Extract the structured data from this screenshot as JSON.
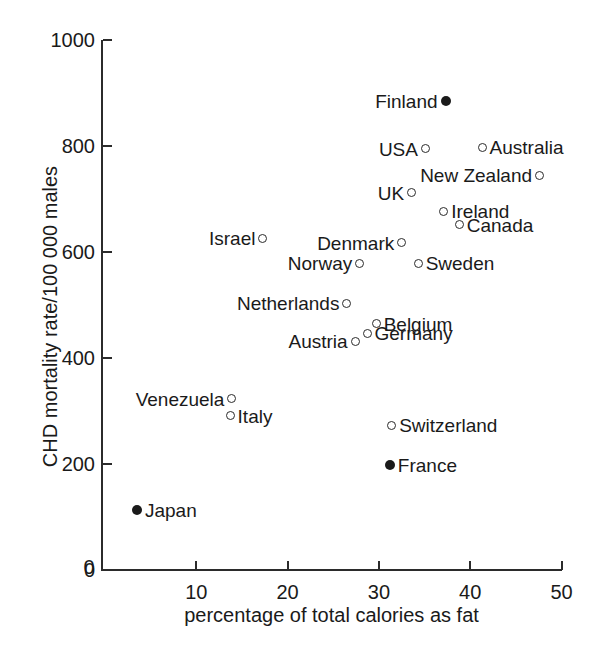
{
  "chart_data": {
    "type": "scatter",
    "title": "",
    "xlabel": "percentage of total calories as fat",
    "ylabel": "CHD mortality rate/100 000 males",
    "xlim": [
      0,
      50
    ],
    "ylim": [
      0,
      1000
    ],
    "xticks": [
      "0",
      "10",
      "20",
      "30",
      "40",
      "50"
    ],
    "xtickvalues": [
      0,
      10,
      20,
      30,
      40,
      50
    ],
    "yticks": [
      "0",
      "200",
      "400",
      "600",
      "800",
      "1000"
    ],
    "ytickvalues": [
      0,
      200,
      400,
      600,
      800,
      1000
    ],
    "grid": false,
    "legend": "none",
    "marker_styles": {
      "open": "open circle",
      "filled": "filled circle"
    },
    "points": [
      {
        "name": "Finland",
        "x": 37.3,
        "y": 885,
        "marker": "filled",
        "label_side": "left"
      },
      {
        "name": "USA",
        "x": 35.1,
        "y": 795,
        "marker": "open",
        "label_side": "left"
      },
      {
        "name": "Australia",
        "x": 41.3,
        "y": 798,
        "marker": "open",
        "label_side": "right"
      },
      {
        "name": "New Zealand",
        "x": 47.6,
        "y": 745,
        "marker": "open",
        "label_side": "left"
      },
      {
        "name": "UK",
        "x": 33.6,
        "y": 712,
        "marker": "open",
        "label_side": "left"
      },
      {
        "name": "Ireland",
        "x": 37.1,
        "y": 677,
        "marker": "open",
        "label_side": "right"
      },
      {
        "name": "Canada",
        "x": 38.8,
        "y": 651,
        "marker": "open",
        "label_side": "right"
      },
      {
        "name": "Israel",
        "x": 17.3,
        "y": 626,
        "marker": "open",
        "label_side": "left"
      },
      {
        "name": "Denmark",
        "x": 32.5,
        "y": 617,
        "marker": "open",
        "label_side": "left"
      },
      {
        "name": "Norway",
        "x": 27.9,
        "y": 579,
        "marker": "open",
        "label_side": "left"
      },
      {
        "name": "Sweden",
        "x": 34.3,
        "y": 579,
        "marker": "open",
        "label_side": "right"
      },
      {
        "name": "Netherlands",
        "x": 26.5,
        "y": 503,
        "marker": "open",
        "label_side": "left"
      },
      {
        "name": "Belgium",
        "x": 29.7,
        "y": 465,
        "marker": "open",
        "label_side": "right"
      },
      {
        "name": "Germany",
        "x": 28.7,
        "y": 447,
        "marker": "open",
        "label_side": "right"
      },
      {
        "name": "Austria",
        "x": 27.4,
        "y": 432,
        "marker": "open",
        "label_side": "left"
      },
      {
        "name": "Venezuela",
        "x": 13.9,
        "y": 323,
        "marker": "open",
        "label_side": "left"
      },
      {
        "name": "Italy",
        "x": 13.7,
        "y": 291,
        "marker": "open",
        "label_side": "right"
      },
      {
        "name": "Switzerland",
        "x": 31.4,
        "y": 273,
        "marker": "open",
        "label_side": "right"
      },
      {
        "name": "France",
        "x": 31.2,
        "y": 198,
        "marker": "filled",
        "label_side": "right"
      },
      {
        "name": "Japan",
        "x": 3.5,
        "y": 113,
        "marker": "filled",
        "label_side": "right"
      }
    ]
  }
}
